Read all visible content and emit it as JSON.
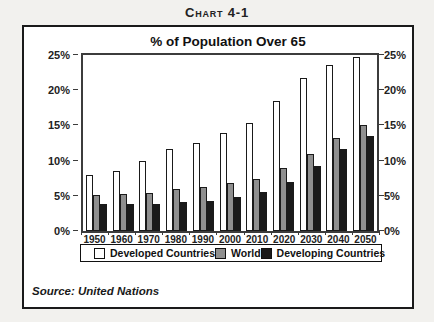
{
  "page": {
    "header_title": "Chart 4-1"
  },
  "chart_data": {
    "type": "bar",
    "title": "% of Population Over 65",
    "xlabel": "",
    "ylabel": "",
    "ylim": [
      0,
      25
    ],
    "grid": false,
    "legend_position": "bottom",
    "y_tick_labels": [
      "0%",
      "5%",
      "10%",
      "15%",
      "20%",
      "25%"
    ],
    "y_tick_values": [
      0,
      5,
      10,
      15,
      20,
      25
    ],
    "categories": [
      "1950",
      "1960",
      "1970",
      "1980",
      "1990",
      "2000",
      "2010",
      "2020",
      "2030",
      "2040",
      "2050"
    ],
    "series": [
      {
        "name": "Developed Countries",
        "color": "#ffffff",
        "border_color": "#1a1a1a",
        "values": [
          7.9,
          8.5,
          9.9,
          11.7,
          12.5,
          13.9,
          15.3,
          18.4,
          21.7,
          23.6,
          24.7
        ]
      },
      {
        "name": "World",
        "color": "#8f8f8f",
        "border_color": "#1a1a1a",
        "values": [
          5.1,
          5.3,
          5.4,
          5.9,
          6.2,
          6.8,
          7.4,
          9.0,
          10.9,
          13.2,
          15.0
        ]
      },
      {
        "name": "Developing Countries",
        "color": "#1a1a1a",
        "border_color": "#1a1a1a",
        "values": [
          3.8,
          3.9,
          3.8,
          4.1,
          4.3,
          4.9,
          5.5,
          7.0,
          9.3,
          11.6,
          13.5
        ]
      }
    ],
    "source": "Source: United Nations"
  }
}
